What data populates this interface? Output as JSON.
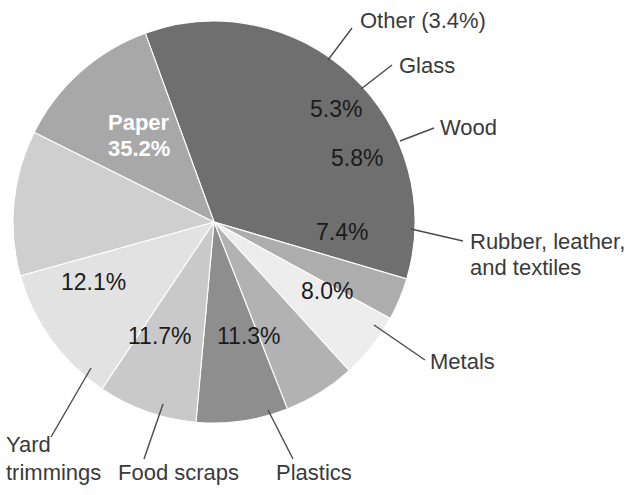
{
  "chart_data": {
    "type": "pie",
    "title": "",
    "subtitle": "",
    "xlabel": "",
    "ylabel": "",
    "legend_position": "none",
    "grid": false,
    "units": "percent",
    "total": 100.2,
    "start_angle_deg": -20,
    "direction": "clockwise",
    "categories": [
      "Paper",
      "Other",
      "Glass",
      "Wood",
      "Rubber, leather, and textiles",
      "Metals",
      "Plastics",
      "Food scraps",
      "Yard trimmings"
    ],
    "values": [
      35.2,
      3.4,
      5.3,
      5.8,
      7.4,
      8.0,
      11.3,
      11.7,
      12.1
    ],
    "value_labels": [
      "35.2%",
      "3.4%",
      "5.3%",
      "5.8%",
      "7.4%",
      "8.0%",
      "11.3%",
      "11.7%",
      "12.1%"
    ],
    "slice_colors": [
      "#6f6f6f",
      "#adadad",
      "#ededed",
      "#b2b2b2",
      "#8e8e8e",
      "#c9c9c9",
      "#e2e2e2",
      "#cfcfcf",
      "#a8a8a8"
    ]
  },
  "slices": [
    {
      "name": "Paper",
      "value": 35.2,
      "value_label": "35.2%",
      "name_label": "Paper",
      "color": "#6f6f6f",
      "label_placement": "inside"
    },
    {
      "name": "Other",
      "value": 3.4,
      "value_label": "3.4%",
      "name_label": "Other (3.4%)",
      "color": "#adadad",
      "label_placement": "callout"
    },
    {
      "name": "Glass",
      "value": 5.3,
      "value_label": "5.3%",
      "name_label": "Glass",
      "color": "#ededed",
      "label_placement": "callout"
    },
    {
      "name": "Wood",
      "value": 5.8,
      "value_label": "5.8%",
      "name_label": "Wood",
      "color": "#b2b2b2",
      "label_placement": "callout"
    },
    {
      "name": "Rubber, leather, and textiles",
      "value": 7.4,
      "value_label": "7.4%",
      "name_label_line1": "Rubber, leather,",
      "name_label_line2": "and textiles",
      "color": "#8e8e8e",
      "label_placement": "callout"
    },
    {
      "name": "Metals",
      "value": 8.0,
      "value_label": "8.0%",
      "name_label": "Metals",
      "color": "#c9c9c9",
      "label_placement": "callout"
    },
    {
      "name": "Plastics",
      "value": 11.3,
      "value_label": "11.3%",
      "name_label": "Plastics",
      "color": "#e2e2e2",
      "label_placement": "callout"
    },
    {
      "name": "Food scraps",
      "value": 11.7,
      "value_label": "11.7%",
      "name_label": "Food scraps",
      "color": "#cfcfcf",
      "label_placement": "callout"
    },
    {
      "name": "Yard trimmings",
      "value": 12.1,
      "value_label": "12.1%",
      "name_label_line1": "Yard",
      "name_label_line2": "trimmings",
      "color": "#a8a8a8",
      "label_placement": "callout"
    }
  ],
  "colors": {
    "background": "#ffffff",
    "leader_line": "#4a4a4a",
    "label_text": "#3a3a3a",
    "value_text": "#1b1b1b",
    "inside_text": "#ffffff"
  }
}
